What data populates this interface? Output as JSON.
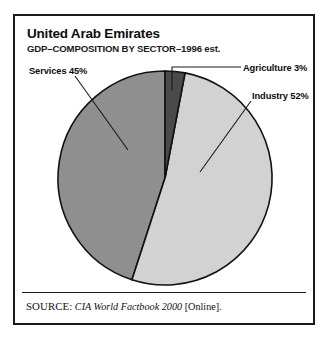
{
  "figure": {
    "title": "United Arab Emirates",
    "subtitle": "GDP–COMPOSITION BY SECTOR–1996 est."
  },
  "labels": {
    "services": "Services 45%",
    "agriculture": "Agriculture 3%",
    "industry": "Industry 52%"
  },
  "source": {
    "label": "SOURCE:",
    "work": "CIA World Factbook 2000",
    "suffix": "[Online]."
  },
  "chart_data": {
    "type": "pie",
    "title": "United Arab Emirates",
    "subtitle": "GDP–COMPOSITION BY SECTOR–1996 est.",
    "xlabel": "",
    "ylabel": "",
    "legend": "none",
    "grid": false,
    "units": "percent of GDP",
    "categories": [
      "Agriculture",
      "Industry",
      "Services"
    ],
    "values": [
      3,
      52,
      45
    ],
    "slices": [
      {
        "name": "Agriculture",
        "value": 3,
        "label": "Agriculture 3%",
        "color": "#4a4a4a",
        "start_angle_deg": 0,
        "end_angle_deg": 10.8
      },
      {
        "name": "Industry",
        "value": 52,
        "label": "Industry 52%",
        "color": "#d2d2d2",
        "start_angle_deg": 10.8,
        "end_angle_deg": 198.0
      },
      {
        "name": "Services",
        "value": 45,
        "label": "Services 45%",
        "color": "#8f8f8f",
        "start_angle_deg": 198.0,
        "end_angle_deg": 360
      }
    ],
    "total": 100,
    "start_angle_deg": 0,
    "direction": "clockwise",
    "source": "CIA World Factbook 2000 [Online]."
  }
}
